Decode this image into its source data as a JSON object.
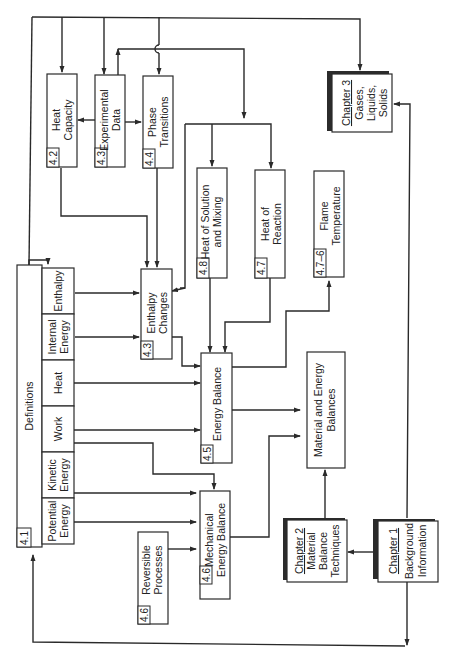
{
  "diagram": {
    "orientation": "rotated 90 degrees counter-clockwise",
    "colors": {
      "line": "#2a2a2a",
      "background": "#ffffff"
    },
    "boxes": {
      "definitions": {
        "section": "4.1",
        "label": "Definitions"
      },
      "def_enthalpy": {
        "label1": "Enthalpy"
      },
      "def_internal_energy": {
        "label1": "Internal",
        "label2": "Energy"
      },
      "def_heat": {
        "label1": "Heat"
      },
      "def_work": {
        "label1": "Work"
      },
      "def_kinetic_energy": {
        "label1": "Kinetic",
        "label2": "Energy"
      },
      "def_potential_energy": {
        "label1": "Potential",
        "label2": "Energy"
      },
      "heat_capacity": {
        "section": "4.2",
        "label1": "Heat",
        "label2": "Capacity"
      },
      "experimental_data": {
        "section": "4.3",
        "label1": "Experimental",
        "label2": "Data"
      },
      "phase_transitions": {
        "section": "4.4",
        "label1": "Phase",
        "label2": "Transitions"
      },
      "enthalpy_changes": {
        "section": "4.3",
        "label1": "Enthalpy",
        "label2": "Changes"
      },
      "heat_of_solution": {
        "section": "4.8",
        "label1": "Heat of Solution",
        "label2": "and Mixing"
      },
      "heat_of_reaction": {
        "section": "4.7",
        "label1": "Heat of",
        "label2": "Reaction"
      },
      "flame_temperature": {
        "section": "4.7–6",
        "label1": "Flame",
        "label2": "Temperature"
      },
      "energy_balance": {
        "section": "4.5",
        "label1": "Energy Balance"
      },
      "mechanical_energy_balance": {
        "section": "4.6",
        "label1": "Mechanical",
        "label2": "Energy Balance"
      },
      "reversible_processes": {
        "section": "4.6",
        "label1": "Reversible",
        "label2": "Processes"
      },
      "material_energy_balances": {
        "label1": "Material and Energy",
        "label2": "Balances"
      },
      "chapter1": {
        "chapter": "Chapter 1",
        "label1": "Background",
        "label2": "Information"
      },
      "chapter2": {
        "chapter": "Chapter 2",
        "label1": "Material",
        "label2": "Balance",
        "label3": "Techniques"
      },
      "chapter3": {
        "chapter": "Chapter 3",
        "label1": "Gases,",
        "label2": "Liquids,",
        "label3": "Solids"
      }
    }
  }
}
